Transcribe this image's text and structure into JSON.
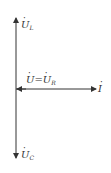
{
  "diagram": {
    "title": "",
    "type": "phasor-diagram",
    "colors": {
      "line": "#333333",
      "background": "#ffffff"
    },
    "vectors": [
      {
        "id": "UL",
        "label_main": "U",
        "label_sub": "L",
        "direction": "up"
      },
      {
        "id": "UR",
        "label_main": "U",
        "label_eq": "=",
        "label_main2": "U",
        "label_sub": "R",
        "direction": "left"
      },
      {
        "id": "I",
        "label_main": "I",
        "label_sub": "",
        "direction": "right"
      },
      {
        "id": "UC",
        "label_main": "U",
        "label_sub": "C",
        "direction": "down"
      }
    ]
  }
}
